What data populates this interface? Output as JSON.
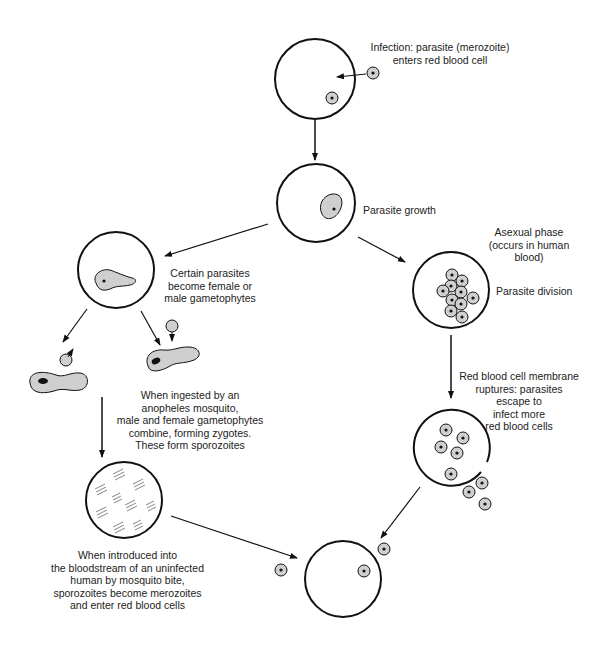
{
  "diagram": {
    "labels": {
      "infection": [
        "Infection:  parasite (merozoite)",
        "enters red blood cell"
      ],
      "growth": [
        "Parasite growth"
      ],
      "asexual": [
        "Asexual phase",
        "(occurs in human",
        "blood)"
      ],
      "division": [
        "Parasite division"
      ],
      "gametophytes": [
        "Certain parasites",
        "become female or",
        "male gametophytes"
      ],
      "rupture": [
        "Red blood cell membrane",
        "ruptures:  parasites",
        "escape to",
        "infect more",
        "red blood cells"
      ],
      "mosquito": [
        "When ingested by an",
        "anopheles mosquito,",
        "male and female gametophytes",
        "combine, forming zygotes.",
        "These form sporozoites"
      ],
      "introduced": [
        "When introduced into",
        "the bloodstream of an uninfected",
        "human by mosquito bite,",
        "sporozoites become merozoites",
        "and enter red blood cells"
      ]
    },
    "colors": {
      "stroke": "#111111",
      "parasite_fill": "#cfcfcf",
      "nucleus": "#111111"
    }
  }
}
